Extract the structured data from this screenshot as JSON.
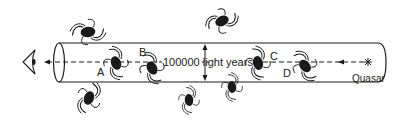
{
  "diagram": {
    "type": "quasar sightline through galactic halos",
    "observer": {
      "icon": "eye-icon"
    },
    "source": {
      "label": "Quasar",
      "icon": "star-icon"
    },
    "scale_label": "100000 light years",
    "galaxy_labels": {
      "a": "A",
      "b": "B",
      "c": "C",
      "d": "D"
    },
    "colors": {
      "ink": "#1a1a1a",
      "background": "#ffffff"
    }
  }
}
